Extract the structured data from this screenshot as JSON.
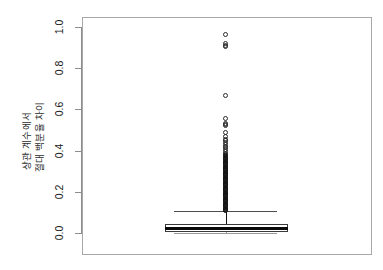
{
  "chart_data": {
    "type": "box",
    "title": "",
    "xlabel": "",
    "ylabel_lines": [
      "상관 계수에서",
      "절대 백분율 차이"
    ],
    "ylim": [
      -0.02,
      1.02
    ],
    "yticks": [
      0.0,
      0.2,
      0.4,
      0.6,
      0.8,
      1.0
    ],
    "ytick_labels": [
      "0.0",
      "0.2",
      "0.4",
      "0.6",
      "0.8",
      "1.0"
    ],
    "grid": false,
    "legend": "none",
    "categories": [
      "전체"
    ],
    "box": {
      "q1": 0.006,
      "median": 0.023,
      "q3": 0.044,
      "whisker_low": 0.0,
      "whisker_high": 0.108,
      "box_left_frac": 0.285,
      "box_right_frac": 0.71,
      "center_frac": 0.495
    },
    "outliers": [
      0.962,
      0.918,
      0.91,
      0.903,
      0.667,
      0.556,
      0.533,
      0.528,
      0.522,
      0.489,
      0.47,
      0.455,
      0.448,
      0.441,
      0.428,
      0.421,
      0.414,
      0.405,
      0.397,
      0.388,
      0.381,
      0.374,
      0.368,
      0.362,
      0.356,
      0.349,
      0.343,
      0.337,
      0.331,
      0.325,
      0.319,
      0.313,
      0.307,
      0.301,
      0.295,
      0.289,
      0.283,
      0.277,
      0.271,
      0.265,
      0.259,
      0.253,
      0.247,
      0.241,
      0.235,
      0.229,
      0.223,
      0.217,
      0.211,
      0.205,
      0.199,
      0.193,
      0.187,
      0.181,
      0.175,
      0.169,
      0.163,
      0.157,
      0.151,
      0.145,
      0.139,
      0.133,
      0.127,
      0.121,
      0.115,
      0.11
    ],
    "outlier_count_note": "dense overlapping cluster below 0.37",
    "colors": {
      "frame": "#a8a8a8",
      "axis": "#8d8d8d",
      "box_border": "#3a3a3a",
      "median": "#0a0a0a",
      "whisker": "#4d4d4d",
      "outlier": "#2a2a2a",
      "background": "#ffffff"
    }
  }
}
